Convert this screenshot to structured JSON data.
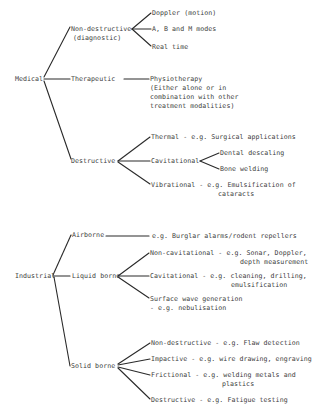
{
  "diagram": {
    "type": "tree",
    "roots": [
      {
        "label": "Medical",
        "children": [
          {
            "label": "Non-destructive",
            "sublabel": "(diagnostic)",
            "children": [
              {
                "label": "Doppler (motion)"
              },
              {
                "label": "A, B and M modes"
              },
              {
                "label": "Real time"
              }
            ]
          },
          {
            "label": "Therapeutic",
            "children": [
              {
                "label": "Physiotherapy",
                "lines": [
                  "(Either alone or in",
                  "combination with other",
                  "treatment modalities)"
                ]
              }
            ]
          },
          {
            "label": "Destructive",
            "children": [
              {
                "label": "Thermal - e.g. Surgical applications"
              },
              {
                "label": "Cavitational",
                "children": [
                  {
                    "label": "Dental descaling"
                  },
                  {
                    "label": "Bone welding"
                  }
                ]
              },
              {
                "label": "Vibrational - e.g. Emulsification of",
                "continuation": "cataracts"
              }
            ]
          }
        ]
      },
      {
        "label": "Industrial",
        "children": [
          {
            "label": "Airborne",
            "children": [
              {
                "label": "e.g. Burglar alarms/rodent repellers"
              }
            ]
          },
          {
            "label": "Liquid borne",
            "children": [
              {
                "label": "Non-cavitational - e.g. Sonar, Doppler,",
                "continuation": "depth measurement"
              },
              {
                "label": "Cavitational - e.g. cleaning, drilling,",
                "continuation": "emulsification"
              },
              {
                "label": "Surface wave generation",
                "continuation": "- e.g. nebulisation"
              }
            ]
          },
          {
            "label": "Solid borne",
            "children": [
              {
                "label": "Non-destructive - e.g. Flaw detection"
              },
              {
                "label": "Impactive - e.g. wire drawing, engraving"
              },
              {
                "label": "Frictional - e.g. welding metals and",
                "continuation": "plastics"
              },
              {
                "label": "Destructive - e.g. Fatigue testing"
              }
            ]
          }
        ]
      }
    ]
  },
  "labels": {
    "medical": "Medical",
    "med_nondestructive": "Non-destructive",
    "med_nondestructive_sub": "(diagnostic)",
    "doppler": "Doppler (motion)",
    "abm_modes": "A, B and M modes",
    "real_time": "Real time",
    "therapeutic": "Therapeutic",
    "physio_1": "Physiotherapy",
    "physio_2": "(Either alone or in",
    "physio_3": "combination with other",
    "physio_4": "treatment modalities)",
    "med_destructive": "Destructive",
    "thermal": "Thermal - e.g. Surgical applications",
    "med_cavitational": "Cavitational",
    "dental": "Dental descaling",
    "bone": "Bone welding",
    "vibrational_1": "Vibrational - e.g. Emulsification of",
    "vibrational_2": "cataracts",
    "industrial": "Industrial",
    "airborne": "Airborne",
    "burglar": "e.g. Burglar alarms/rodent repellers",
    "liquid_borne": "Liquid borne",
    "noncav_1": "Non-cavitational - e.g. Sonar, Doppler,",
    "noncav_2": "depth measurement",
    "ind_cav_1": "Cavitational - e.g. cleaning, drilling,",
    "ind_cav_2": "emulsification",
    "surface_1": "Surface wave generation",
    "surface_2": "- e.g. nebulisation",
    "solid_borne": "Solid borne",
    "solid_nondestructive": "Non-destructive - e.g. Flaw detection",
    "impactive": "Impactive - e.g. wire drawing, engraving",
    "frictional_1": "Frictional - e.g. welding metals and",
    "frictional_2": "plastics",
    "solid_destructive": "Destructive - e.g. Fatigue testing"
  }
}
